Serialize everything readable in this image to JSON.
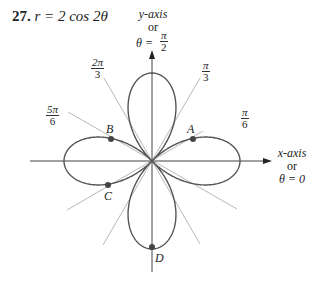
{
  "title": {
    "number": "27.",
    "equation": "r = 2 cos 2θ"
  },
  "axes": {
    "y_axis_label": [
      "y-axis",
      "or",
      "θ ="
    ],
    "y_axis_angle": {
      "num": "π",
      "den": "2"
    },
    "x_axis_label": [
      "x-axis",
      "or",
      "θ = 0"
    ]
  },
  "angle_labels": [
    {
      "num": "π",
      "den": "6"
    },
    {
      "num": "π",
      "den": "3"
    },
    {
      "num": "2π",
      "den": "3"
    },
    {
      "num": "5π",
      "den": "6"
    }
  ],
  "points": [
    {
      "label": "A"
    },
    {
      "label": "B"
    },
    {
      "label": "C"
    },
    {
      "label": "D"
    }
  ],
  "colors": {
    "curve": "#555555",
    "axis": "#444444",
    "ray": "#aaaaaa",
    "point": "#444444"
  },
  "chart_data": {
    "type": "polar",
    "equation": "r = 2 cos 2θ",
    "rays": [
      "π/6",
      "π/3",
      "2π/3",
      "5π/6"
    ],
    "marked_points": [
      {
        "label": "A",
        "theta": "π/6",
        "r": 1
      },
      {
        "label": "B",
        "theta": "5π/6",
        "r": 1
      },
      {
        "label": "C",
        "theta": "7π/6",
        "r": 1
      },
      {
        "label": "D",
        "theta": "3π/2",
        "r": 2
      }
    ],
    "petal_max_r": 2
  }
}
